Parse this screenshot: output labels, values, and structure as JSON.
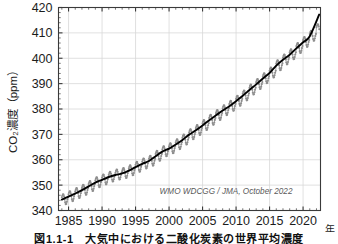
{
  "figure": {
    "caption": "図1.1-1　大気中における二酸化炭素の世界平均濃度",
    "credit": "WMO WDCGG / JMA, October 2022"
  },
  "chart_data": {
    "type": "line",
    "title": "",
    "subtitle": "",
    "xlabel": "年",
    "ylabel": "CO₂濃度（ppm）",
    "xlim": [
      1983.5,
      2022.6
    ],
    "ylim": [
      340,
      420
    ],
    "xticks": [
      1985,
      1990,
      1995,
      2000,
      2005,
      2010,
      2015,
      2020
    ],
    "yticks": [
      340,
      350,
      360,
      370,
      380,
      390,
      400,
      410,
      420
    ],
    "grid": true,
    "legend_position": "none",
    "annotations": [
      {
        "text": "WMO WDCGG / JMA, October 2022",
        "x": 2008.5,
        "y": 346.5
      }
    ],
    "series": [
      {
        "name": "月平均濃度",
        "style": "markers-line",
        "color": "#8e8e8e",
        "marker": "circle",
        "x": [
          1984.0,
          1984.08,
          1984.17,
          1984.25,
          1984.33,
          1984.42,
          1984.5,
          1984.58,
          1984.67,
          1984.75,
          1984.83,
          1984.92,
          1985.0,
          1985.08,
          1985.17,
          1985.25,
          1985.33,
          1985.42,
          1985.5,
          1985.58,
          1985.67,
          1985.75,
          1985.83,
          1985.92,
          1986.0,
          1986.08,
          1986.17,
          1986.25,
          1986.33,
          1986.42,
          1986.5,
          1986.58,
          1986.67,
          1986.75,
          1986.83,
          1986.92,
          1987.0,
          1987.08,
          1987.17,
          1987.25,
          1987.33,
          1987.42,
          1987.5,
          1987.58,
          1987.67,
          1987.75,
          1987.83,
          1987.92,
          1988.0,
          1988.08,
          1988.17,
          1988.25,
          1988.33,
          1988.42,
          1988.5,
          1988.58,
          1988.67,
          1988.75,
          1988.83,
          1988.92,
          1989.0,
          1989.08,
          1989.17,
          1989.25,
          1989.33,
          1989.42,
          1989.5,
          1989.58,
          1989.67,
          1989.75,
          1989.83,
          1989.92,
          1990.0,
          1990.08,
          1990.17,
          1990.25,
          1990.33,
          1990.42,
          1990.5,
          1990.58,
          1990.67,
          1990.75,
          1990.83,
          1990.92,
          1991.0,
          1991.08,
          1991.17,
          1991.25,
          1991.33,
          1991.42,
          1991.5,
          1991.58,
          1991.67,
          1991.75,
          1991.83,
          1991.92,
          1992.0,
          1992.08,
          1992.17,
          1992.25,
          1992.33,
          1992.42,
          1992.5,
          1992.58,
          1992.67,
          1992.75,
          1992.83,
          1992.92,
          1993.0,
          1993.08,
          1993.17,
          1993.25,
          1993.33,
          1993.42,
          1993.5,
          1993.58,
          1993.67,
          1993.75,
          1993.83,
          1993.92,
          1994.0,
          1994.08,
          1994.17,
          1994.25,
          1994.33,
          1994.42,
          1994.5,
          1994.58,
          1994.67,
          1994.75,
          1994.83,
          1994.92,
          1995.0,
          1995.08,
          1995.17,
          1995.25,
          1995.33,
          1995.42,
          1995.5,
          1995.58,
          1995.67,
          1995.75,
          1995.83,
          1995.92,
          1996.0,
          1996.08,
          1996.17,
          1996.25,
          1996.33,
          1996.42,
          1996.5,
          1996.58,
          1996.67,
          1996.75,
          1996.83,
          1996.92,
          1997.0,
          1997.08,
          1997.17,
          1997.25,
          1997.33,
          1997.42,
          1997.5,
          1997.58,
          1997.67,
          1997.75,
          1997.83,
          1997.92,
          1998.0,
          1998.08,
          1998.17,
          1998.25,
          1998.33,
          1998.42,
          1998.5,
          1998.58,
          1998.67,
          1998.75,
          1998.83,
          1998.92,
          1999.0,
          1999.08,
          1999.17,
          1999.25,
          1999.33,
          1999.42,
          1999.5,
          1999.58,
          1999.67,
          1999.75,
          1999.83,
          1999.92,
          2000.0,
          2000.08,
          2000.17,
          2000.25,
          2000.33,
          2000.42,
          2000.5,
          2000.58,
          2000.67,
          2000.75,
          2000.83,
          2000.92,
          2001.0,
          2001.08,
          2001.17,
          2001.25,
          2001.33,
          2001.42,
          2001.5,
          2001.58,
          2001.67,
          2001.75,
          2001.83,
          2001.92,
          2002.0,
          2002.08,
          2002.17,
          2002.25,
          2002.33,
          2002.42,
          2002.5,
          2002.58,
          2002.67,
          2002.75,
          2002.83,
          2002.92,
          2003.0,
          2003.08,
          2003.17,
          2003.25,
          2003.33,
          2003.42,
          2003.5,
          2003.58,
          2003.67,
          2003.75,
          2003.83,
          2003.92,
          2004.0,
          2004.08,
          2004.17,
          2004.25,
          2004.33,
          2004.42,
          2004.5,
          2004.58,
          2004.67,
          2004.75,
          2004.83,
          2004.92,
          2005.0,
          2005.08,
          2005.17,
          2005.25,
          2005.33,
          2005.42,
          2005.5,
          2005.58,
          2005.67,
          2005.75,
          2005.83,
          2005.92,
          2006.0,
          2006.08,
          2006.17,
          2006.25,
          2006.33,
          2006.42,
          2006.5,
          2006.58,
          2006.67,
          2006.75,
          2006.83,
          2006.92,
          2007.0,
          2007.08,
          2007.17,
          2007.25,
          2007.33,
          2007.42,
          2007.5,
          2007.58,
          2007.67,
          2007.75,
          2007.83,
          2007.92,
          2008.0,
          2008.08,
          2008.17,
          2008.25,
          2008.33,
          2008.42,
          2008.5,
          2008.58,
          2008.67,
          2008.75,
          2008.83,
          2008.92,
          2009.0,
          2009.08,
          2009.17,
          2009.25,
          2009.33,
          2009.42,
          2009.5,
          2009.58,
          2009.67,
          2009.75,
          2009.83,
          2009.92,
          2010.0,
          2010.08,
          2010.17,
          2010.25,
          2010.33,
          2010.42,
          2010.5,
          2010.58,
          2010.67,
          2010.75,
          2010.83,
          2010.92,
          2011.0,
          2011.08,
          2011.17,
          2011.25,
          2011.33,
          2011.42,
          2011.5,
          2011.58,
          2011.67,
          2011.75,
          2011.83,
          2011.92,
          2012.0,
          2012.08,
          2012.17,
          2012.25,
          2012.33,
          2012.42,
          2012.5,
          2012.58,
          2012.67,
          2012.75,
          2012.83,
          2012.92,
          2013.0,
          2013.08,
          2013.17,
          2013.25,
          2013.33,
          2013.42,
          2013.5,
          2013.58,
          2013.67,
          2013.75,
          2013.83,
          2013.92,
          2014.0,
          2014.08,
          2014.17,
          2014.25,
          2014.33,
          2014.42,
          2014.5,
          2014.58,
          2014.67,
          2014.75,
          2014.83,
          2014.92,
          2015.0,
          2015.08,
          2015.17,
          2015.25,
          2015.33,
          2015.42,
          2015.5,
          2015.58,
          2015.67,
          2015.75,
          2015.83,
          2015.92,
          2016.0,
          2016.08,
          2016.17,
          2016.25,
          2016.33,
          2016.42,
          2016.5,
          2016.58,
          2016.67,
          2016.75,
          2016.83,
          2016.92,
          2017.0,
          2017.08,
          2017.17,
          2017.25,
          2017.33,
          2017.42,
          2017.5,
          2017.58,
          2017.67,
          2017.75,
          2017.83,
          2017.92,
          2018.0,
          2018.08,
          2018.17,
          2018.25,
          2018.33,
          2018.42,
          2018.5,
          2018.58,
          2018.67,
          2018.75,
          2018.83,
          2018.92,
          2019.0,
          2019.08,
          2019.17,
          2019.25,
          2019.33,
          2019.42,
          2019.5,
          2019.58,
          2019.67,
          2019.75,
          2019.83,
          2019.92,
          2020.0,
          2020.08,
          2020.17,
          2020.25,
          2020.33,
          2020.42,
          2020.5,
          2020.58,
          2020.67,
          2020.75,
          2020.83,
          2020.92,
          2021.0,
          2021.08,
          2021.17,
          2021.25,
          2021.33,
          2021.42,
          2021.5,
          2021.58,
          2021.67,
          2021.75,
          2021.83,
          2021.92,
          2022.0,
          2022.08,
          2022.17,
          2022.25,
          2022.33,
          2022.42
        ],
        "y": [
          345.2,
          345.9,
          346.4,
          346.3,
          345.6,
          344.4,
          343.2,
          342.5,
          342.6,
          343.4,
          344.4,
          345.2,
          346.4,
          347.1,
          347.6,
          347.5,
          346.8,
          345.6,
          344.4,
          343.7,
          343.8,
          344.6,
          345.6,
          346.4,
          347.6,
          348.3,
          348.8,
          348.7,
          348.0,
          346.8,
          345.6,
          344.9,
          345.0,
          345.8,
          346.8,
          347.6,
          348.9,
          349.6,
          350.1,
          350.0,
          349.3,
          348.1,
          346.9,
          346.2,
          346.3,
          347.1,
          348.1,
          348.9,
          350.4,
          351.1,
          351.6,
          351.5,
          350.8,
          349.6,
          348.4,
          347.7,
          347.8,
          348.6,
          349.6,
          350.4,
          351.9,
          352.6,
          353.1,
          353.0,
          352.3,
          351.1,
          349.9,
          349.2,
          349.3,
          350.1,
          351.1,
          351.9,
          353.0,
          353.7,
          354.2,
          354.1,
          353.4,
          352.2,
          351.0,
          350.3,
          350.4,
          351.2,
          352.2,
          353.0,
          354.1,
          354.8,
          355.3,
          355.2,
          354.5,
          353.3,
          352.1,
          351.4,
          351.5,
          352.3,
          353.3,
          354.1,
          354.9,
          355.6,
          356.1,
          356.0,
          355.3,
          354.1,
          352.9,
          352.2,
          352.3,
          353.1,
          354.1,
          354.9,
          355.5,
          356.2,
          356.7,
          356.6,
          355.9,
          354.7,
          353.5,
          352.8,
          352.9,
          353.7,
          354.7,
          355.5,
          356.6,
          357.3,
          357.8,
          357.7,
          357.0,
          355.8,
          354.6,
          353.9,
          354.0,
          354.8,
          355.8,
          356.6,
          358.0,
          358.7,
          359.2,
          359.1,
          358.4,
          357.2,
          356.0,
          355.3,
          355.4,
          356.2,
          357.2,
          358.0,
          359.3,
          360.0,
          360.5,
          360.4,
          359.7,
          358.5,
          357.3,
          356.6,
          356.7,
          357.5,
          358.5,
          359.3,
          360.4,
          361.1,
          361.6,
          361.5,
          360.8,
          359.6,
          358.4,
          357.7,
          357.8,
          358.6,
          359.6,
          360.4,
          362.3,
          363.0,
          363.5,
          363.4,
          362.7,
          361.5,
          360.3,
          359.6,
          359.7,
          360.5,
          361.5,
          362.3,
          364.1,
          364.8,
          365.3,
          365.2,
          364.5,
          363.3,
          362.1,
          361.4,
          361.5,
          362.3,
          363.3,
          364.1,
          365.3,
          366.0,
          366.5,
          366.4,
          365.7,
          364.5,
          363.3,
          362.6,
          362.7,
          363.5,
          364.5,
          365.3,
          366.9,
          367.6,
          368.1,
          368.0,
          367.3,
          366.1,
          364.9,
          364.2,
          364.3,
          365.1,
          366.1,
          366.9,
          368.7,
          369.4,
          369.9,
          369.8,
          369.1,
          367.9,
          366.7,
          366.0,
          366.1,
          366.9,
          367.9,
          368.7,
          370.8,
          371.5,
          372.0,
          371.9,
          371.2,
          370.0,
          368.8,
          368.1,
          368.2,
          369.0,
          370.0,
          370.8,
          372.5,
          373.2,
          373.7,
          373.6,
          372.9,
          371.7,
          370.5,
          369.8,
          369.9,
          370.7,
          371.7,
          372.5,
          374.4,
          375.1,
          375.6,
          375.5,
          374.8,
          373.6,
          372.4,
          371.7,
          371.8,
          372.6,
          373.6,
          374.4,
          376.5,
          377.2,
          377.7,
          377.6,
          376.9,
          375.7,
          374.5,
          373.8,
          373.9,
          374.7,
          375.7,
          376.5,
          378.4,
          379.1,
          379.6,
          379.5,
          378.8,
          377.6,
          376.4,
          375.7,
          375.8,
          376.6,
          377.6,
          378.4,
          380.3,
          381.0,
          381.5,
          381.4,
          380.7,
          379.5,
          378.3,
          377.6,
          377.7,
          378.5,
          379.5,
          380.3,
          382.0,
          382.7,
          383.2,
          383.1,
          382.4,
          381.2,
          380.0,
          379.3,
          379.4,
          380.2,
          381.2,
          382.0,
          384.0,
          384.7,
          385.2,
          385.1,
          384.4,
          383.2,
          382.0,
          381.3,
          381.4,
          382.2,
          383.2,
          384.0,
          386.1,
          386.8,
          387.3,
          387.2,
          386.5,
          385.3,
          384.1,
          383.4,
          383.5,
          384.3,
          385.3,
          386.1,
          388.4,
          389.1,
          389.6,
          389.5,
          388.8,
          387.6,
          386.4,
          385.7,
          385.8,
          386.6,
          387.6,
          388.4,
          390.6,
          391.3,
          391.8,
          391.7,
          391.0,
          389.8,
          388.6,
          387.9,
          388.0,
          388.8,
          389.8,
          390.6,
          392.9,
          393.6,
          394.1,
          394.0,
          393.3,
          392.1,
          390.9,
          390.2,
          390.3,
          391.1,
          392.1,
          392.9,
          395.1,
          395.8,
          396.3,
          396.2,
          395.5,
          394.3,
          393.1,
          392.4,
          392.5,
          393.3,
          394.3,
          395.1,
          398.0,
          398.7,
          399.2,
          399.1,
          398.4,
          397.2,
          396.0,
          395.3,
          395.4,
          396.2,
          397.2,
          398.0,
          400.3,
          401.0,
          401.5,
          401.4,
          400.7,
          399.5,
          398.3,
          397.6,
          397.7,
          398.5,
          399.5,
          400.3,
          402.3,
          403.0,
          403.5,
          403.4,
          402.7,
          401.5,
          400.3,
          399.6,
          399.7,
          400.5,
          401.5,
          402.3,
          404.8,
          405.5,
          406.0,
          405.9,
          405.2,
          404.0,
          402.8,
          402.1,
          402.2,
          403.0,
          404.0,
          404.8,
          407.2,
          407.9,
          408.4,
          408.3,
          407.6,
          406.4,
          405.2,
          404.5,
          404.6,
          405.4,
          406.4,
          407.2,
          409.6,
          410.3,
          410.8,
          410.7,
          410.0,
          408.8,
          407.6,
          406.9,
          407.0,
          407.8,
          408.8,
          409.6,
          412.2,
          412.9,
          413.4,
          413.3,
          412.6,
          411.4
        ]
      },
      {
        "name": "季節変動を除いた濃度（トレンド）",
        "style": "line",
        "color": "#000000",
        "x": [
          1984.0,
          1985.0,
          1986.0,
          1987.0,
          1988.0,
          1989.0,
          1990.0,
          1991.0,
          1992.0,
          1993.0,
          1994.0,
          1995.0,
          1996.0,
          1997.0,
          1998.0,
          1999.0,
          2000.0,
          2001.0,
          2002.0,
          2003.0,
          2004.0,
          2005.0,
          2006.0,
          2007.0,
          2008.0,
          2009.0,
          2010.0,
          2011.0,
          2012.0,
          2013.0,
          2014.0,
          2015.0,
          2016.0,
          2017.0,
          2018.0,
          2019.0,
          2020.0,
          2021.0,
          2022.4
        ],
        "y": [
          344.3,
          345.5,
          346.7,
          348.0,
          349.5,
          351.0,
          352.1,
          353.2,
          354.0,
          354.6,
          355.7,
          357.1,
          358.4,
          359.5,
          361.4,
          363.2,
          364.4,
          366.0,
          367.8,
          369.9,
          371.6,
          373.5,
          375.6,
          377.5,
          379.4,
          381.1,
          383.1,
          385.2,
          387.5,
          389.7,
          392.0,
          394.2,
          397.1,
          399.4,
          401.4,
          403.9,
          406.3,
          408.7,
          417.2
        ]
      }
    ]
  },
  "axes": {
    "y_tick_labels": [
      "340",
      "350",
      "360",
      "370",
      "380",
      "390",
      "400",
      "410",
      "420"
    ],
    "x_tick_labels": [
      "1985",
      "1990",
      "1995",
      "2000",
      "2005",
      "2010",
      "2015",
      "2020"
    ],
    "y_axis_title": "CO₂濃度（ppm）",
    "x_axis_unit": "年"
  },
  "colors": {
    "data_gray": "#8e8e8e",
    "trend_black": "#000000",
    "grid": "#d8d8d8",
    "axis": "#3a3a3a",
    "credit": "#5a5a5a"
  }
}
